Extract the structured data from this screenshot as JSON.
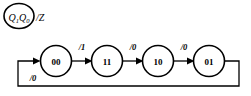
{
  "diagram": {
    "type": "state-transition-diagram",
    "background_color": "#ffffff",
    "stroke_color": "#000000",
    "legend": {
      "state_var_1": "Q",
      "state_var_1_sub": "1",
      "state_var_0": "Q",
      "state_var_0_sub": "0",
      "output_label": "/Z"
    },
    "states": [
      {
        "id": "s0",
        "label": "00",
        "cx": 56,
        "cy": 61,
        "r": 15.5
      },
      {
        "id": "s1",
        "label": "11",
        "cx": 107,
        "cy": 61,
        "r": 15.5
      },
      {
        "id": "s2",
        "label": "10",
        "cx": 158,
        "cy": 61,
        "r": 15.5
      },
      {
        "id": "s3",
        "label": "01",
        "cx": 209,
        "cy": 61,
        "r": 15.5
      }
    ],
    "transitions": [
      {
        "id": "t0",
        "from": "00",
        "to": "11",
        "label": "/1",
        "label_x": 82,
        "label_y": 47
      },
      {
        "id": "t1",
        "from": "11",
        "to": "10",
        "label": "/0",
        "label_x": 133,
        "label_y": 47
      },
      {
        "id": "t2",
        "from": "10",
        "to": "01",
        "label": "/0",
        "label_x": 184,
        "label_y": 47
      },
      {
        "id": "t3",
        "from": "01",
        "to": "00",
        "label": "/0",
        "label_x": 33,
        "label_y": 78
      }
    ]
  }
}
